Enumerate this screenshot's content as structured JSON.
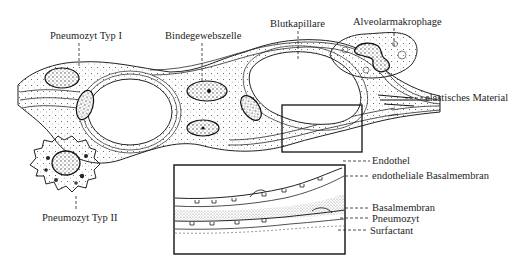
{
  "figure": {
    "labels": {
      "pneumozyt_typ1": "Pneumozyt Typ I",
      "bindegewebszelle": "Bindegewebszelle",
      "blutkapillare": "Blutkapillare",
      "alveolarmakrophage": "Alveolarmakrophage",
      "elastisches_material": "elastisches Material",
      "pneumozyt_typ2": "Pneumozyt Typ II"
    },
    "inset": {
      "labels": {
        "endothel": "Endothel",
        "endotheliale_basalmembran": "endotheliale Basalmembran",
        "basalmembran": "Basalmembran",
        "pneumozyt": "Pneumozyt",
        "surfactant": "Surfactant"
      }
    },
    "colors": {
      "ink": "#1e1e1e",
      "background": "#ffffff",
      "stipple": "#6a6a6a"
    }
  }
}
